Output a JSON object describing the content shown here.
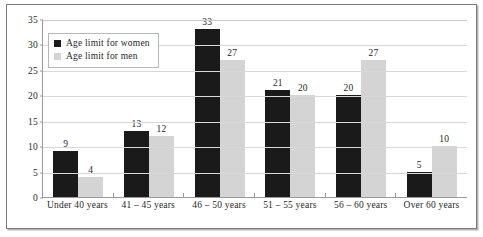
{
  "chart_data": {
    "type": "bar",
    "title": "",
    "subtitle": "",
    "xlabel": "",
    "ylabel": "",
    "ylim": [
      0,
      35
    ],
    "yticks": [
      0,
      5,
      10,
      15,
      20,
      25,
      30,
      35
    ],
    "grid": true,
    "legend_position": "upper-left-inside",
    "categories": [
      "Under 40 years",
      "41 – 45 years",
      "46 – 50 years",
      "51 – 55 years",
      "56 – 60 years",
      "Over 60 years"
    ],
    "series": [
      {
        "name": "Age limit for women",
        "color": "#1a1a1a",
        "values": [
          9,
          13,
          33,
          21,
          20,
          5
        ]
      },
      {
        "name": "Age limit for men",
        "color": "#d4d4d4",
        "values": [
          4,
          12,
          27,
          20,
          27,
          10
        ]
      }
    ]
  },
  "legend": {
    "items": [
      {
        "label": "Age limit for women",
        "swatch": "legend-swatch-women"
      },
      {
        "label": "Age limit for men",
        "swatch": "legend-swatch-men"
      }
    ]
  },
  "axis": {
    "y_tick_labels": [
      "35",
      "30",
      "25",
      "20",
      "15",
      "10",
      "5",
      "0"
    ]
  }
}
